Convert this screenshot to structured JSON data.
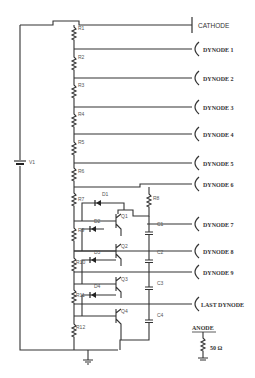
{
  "diagram": {
    "type": "photomultiplier voltage divider schematic",
    "source": {
      "label": "V1"
    },
    "electrodes": [
      {
        "label": "CATHODE",
        "y": 25,
        "kind": "cathode"
      },
      {
        "label": "DYNODE 1",
        "y": 49
      },
      {
        "label": "DYNODE 2",
        "y": 78
      },
      {
        "label": "DYNODE 3",
        "y": 107
      },
      {
        "label": "DYNODE 4",
        "y": 134
      },
      {
        "label": "DYNODE 5",
        "y": 163
      },
      {
        "label": "DYNODE 6",
        "y": 187
      },
      {
        "label": "DYNODE 7",
        "y": 214
      },
      {
        "label": "DYNODE 8",
        "y": 241
      },
      {
        "label": "DYNODE 9",
        "y": 272
      },
      {
        "label": "LAST DYNODE",
        "y": 304
      }
    ],
    "resistors": [
      "R1",
      "R2",
      "R3",
      "R4",
      "R5",
      "R6",
      "R7",
      "R9",
      "R10",
      "R11",
      "R12",
      "R8"
    ],
    "diodes": [
      "D1",
      "D2",
      "D3",
      "D4"
    ],
    "transistors": [
      "Q1",
      "Q2",
      "Q3",
      "Q4"
    ],
    "capacitors": [
      "C1",
      "C2",
      "C3",
      "C4"
    ],
    "anode": {
      "label": "ANODE",
      "load": "50 Ω"
    }
  }
}
